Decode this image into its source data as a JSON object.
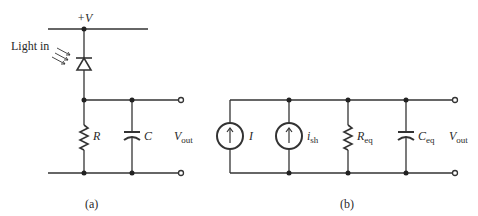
{
  "figure": {
    "panel_a": {
      "caption": "(a)",
      "supply_label": "+V",
      "light_label": "Light in",
      "resistor": "R",
      "capacitor": "C",
      "output": {
        "main": "V",
        "sub": "out"
      }
    },
    "panel_b": {
      "caption": "(b)",
      "source1": "I",
      "source2": {
        "main": "i",
        "sub": "sh"
      },
      "resistor": {
        "main": "R",
        "sub": "eq"
      },
      "capacitor": {
        "main": "C",
        "sub": "eq"
      },
      "output": {
        "main": "V",
        "sub": "out"
      }
    }
  },
  "colors": {
    "line": "#333333",
    "background": "#ffffff"
  }
}
